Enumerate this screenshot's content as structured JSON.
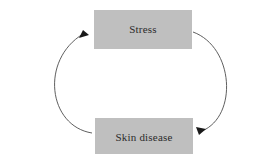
{
  "diagram": {
    "type": "cycle",
    "title": "",
    "background_color": "#ffffff",
    "nodes": [
      {
        "id": "stress",
        "label": "Stress",
        "fill_color": "#bfbfbf",
        "text_color": "#2b2b2b",
        "position": "top"
      },
      {
        "id": "skin_disease",
        "label": "Skin disease",
        "fill_color": "#bfbfbf",
        "text_color": "#2b2b2b",
        "position": "bottom"
      }
    ],
    "edges": [
      {
        "id": "skin-disease-to-stress",
        "from": "skin_disease",
        "to": "stress",
        "label": "",
        "side": "left",
        "style": "curved-arrow",
        "color": "#4d4d4d"
      },
      {
        "id": "stress-to-skin-disease",
        "from": "stress",
        "to": "skin_disease",
        "label": "",
        "side": "right",
        "style": "curved-arrow",
        "color": "#4d4d4d"
      }
    ]
  }
}
